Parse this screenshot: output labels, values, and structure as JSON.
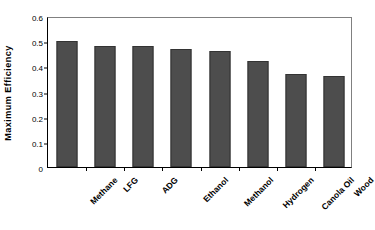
{
  "chart": {
    "type": "bar",
    "title": "",
    "ylabel": "Maximum Efficiency",
    "xlabel": ""
  },
  "chart_data": {
    "type": "bar",
    "title": "",
    "xlabel": "",
    "ylabel": "Maximum Efficiency",
    "categories": [
      "Methane",
      "LFG",
      "ADG",
      "Ethanol",
      "Methanol",
      "Hydrogen",
      "Canola Oil",
      "Wood"
    ],
    "values": [
      0.5,
      0.48,
      0.48,
      0.47,
      0.46,
      0.42,
      0.37,
      0.36
    ],
    "ylim": [
      0,
      0.6
    ],
    "yticks": [
      "0",
      "0.1",
      "0.2",
      "0.3",
      "0.4",
      "0.5",
      "0.6"
    ],
    "ytick_values": [
      0,
      0.1,
      0.2,
      0.3,
      0.4,
      0.5,
      0.6
    ],
    "grid": false,
    "legend": false,
    "legend_position": "none",
    "series": [
      {
        "name": "Maximum Efficiency",
        "values": [
          0.5,
          0.48,
          0.48,
          0.47,
          0.46,
          0.42,
          0.37,
          0.36
        ]
      }
    ],
    "bar_color": "#4d4d4d",
    "bar_edge_color": "#333333",
    "axis_color": "#000000",
    "background_color": "#ffffff"
  }
}
